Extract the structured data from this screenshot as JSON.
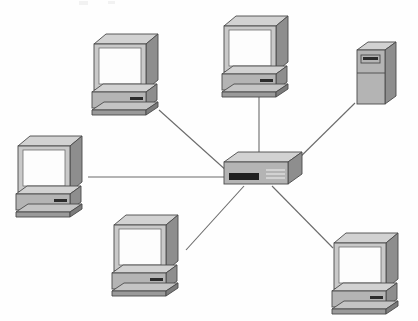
{
  "diagram": {
    "type": "network-topology",
    "topology": "star",
    "caption": "Six end devices connected by individual cable runs to a single central hub",
    "canvas": {
      "width": 418,
      "height": 321,
      "background": "#fefefe"
    },
    "palette": {
      "background": "#fefefe",
      "device_top": "#d2d2d2",
      "device_front": "#b4b4b4",
      "device_side": "#8e8e8e",
      "screen": "#fdfdfd",
      "outline": "#4a4a4a",
      "link": "#6b6b6b",
      "port_dark": "#1f1f1f"
    },
    "hub": {
      "label": "Central hub",
      "kind": "ethernet-hub",
      "x": 224,
      "y": 155,
      "width": 64,
      "height": 30,
      "port_count": 6,
      "front_port_block": "dark port bank",
      "front_vent_lines": 3
    },
    "nodes": [
      {
        "id": "node-top-left",
        "label": "Workstation top left",
        "kind": "desktop-computer",
        "x": 92,
        "y": 32,
        "scale": 1.0,
        "connects_to": "hub"
      },
      {
        "id": "node-top-center",
        "label": "Workstation top center",
        "kind": "desktop-computer",
        "x": 222,
        "y": 14,
        "scale": 1.0,
        "connects_to": "hub"
      },
      {
        "id": "node-right-tower",
        "label": "Tower server right",
        "kind": "tower-server",
        "x": 355,
        "y": 40,
        "scale": 1.0,
        "connects_to": "hub"
      },
      {
        "id": "node-left-middle",
        "label": "Workstation left middle",
        "kind": "desktop-computer",
        "x": 16,
        "y": 134,
        "scale": 1.0,
        "connects_to": "hub"
      },
      {
        "id": "node-bottom-left",
        "label": "Workstation bottom left",
        "kind": "desktop-computer",
        "x": 112,
        "y": 213,
        "scale": 1.0,
        "connects_to": "hub"
      },
      {
        "id": "node-bottom-right",
        "label": "Workstation bottom right",
        "kind": "desktop-computer",
        "x": 332,
        "y": 231,
        "scale": 1.0,
        "connects_to": "hub"
      }
    ],
    "links": [
      {
        "id": "link-top-left",
        "from": "node-top-left",
        "to": "hub",
        "path": "M 159 110 L 228 172"
      },
      {
        "id": "link-top-center",
        "from": "node-top-center",
        "to": "hub",
        "path": "M 259 89 L 259 158"
      },
      {
        "id": "link-right-tower",
        "from": "node-right-tower",
        "to": "hub",
        "path": "M 355 103 L 289 168"
      },
      {
        "id": "link-left-middle",
        "from": "node-left-middle",
        "to": "hub",
        "path": "M 88 177 L 226 177"
      },
      {
        "id": "link-bottom-left",
        "from": "node-bottom-left",
        "to": "hub",
        "path": "M 186 250 L 244 186"
      },
      {
        "id": "link-bottom-right",
        "from": "node-bottom-right",
        "to": "hub",
        "path": "M 333 248 L 272 186"
      }
    ]
  }
}
